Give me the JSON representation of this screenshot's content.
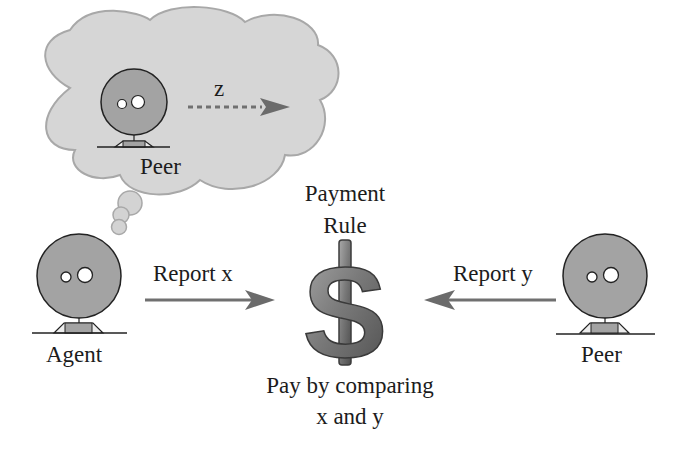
{
  "thought_bubble": {
    "peer_label": "Peer",
    "signal_label": "z"
  },
  "agent": {
    "label": "Agent"
  },
  "peer": {
    "label": "Peer"
  },
  "arrows": {
    "left_label": "Report x",
    "right_label": "Report y"
  },
  "payment_rule": {
    "title_line1": "Payment",
    "title_line2": "Rule",
    "icon": "dollar-sign-icon",
    "caption_line1": "Pay by comparing",
    "caption_line2": "x and y"
  },
  "colors": {
    "cloud_fill": "#d6d6d6",
    "cloud_stroke": "#a8a8a8",
    "head_fill": "#a3a3a3",
    "arrow": "#6e6e6e",
    "dollar": "#7b7b7b",
    "text": "#1c1c1c"
  }
}
